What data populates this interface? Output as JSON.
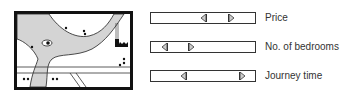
{
  "map": {
    "road_color": "#d4d4d4",
    "frame_color": "#111111"
  },
  "sliders": [
    {
      "id": "price",
      "label": "Price",
      "min_pos": 0.5,
      "max_pos": 0.75
    },
    {
      "id": "bedrooms",
      "label": "No. of bedrooms",
      "min_pos": 0.1,
      "max_pos": 0.36
    },
    {
      "id": "journey",
      "label": "Journey time",
      "min_pos": 0.3,
      "max_pos": 0.86
    }
  ]
}
